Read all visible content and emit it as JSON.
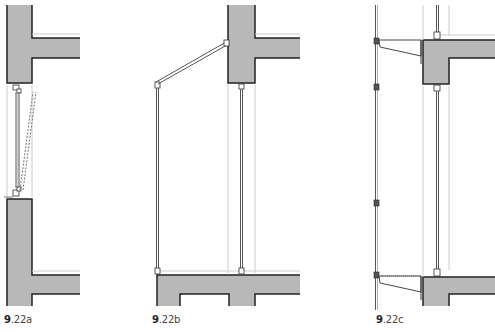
{
  "colors": {
    "concrete_fill": "#b8b8b8",
    "outline": "#222222",
    "frame_line": "#555555",
    "guide_line": "#cccccc",
    "background": "#ffffff"
  },
  "figures": [
    {
      "id": "9.22a",
      "caption_number": "9",
      "caption_suffix": ".22a",
      "description": "Pivot window between slab edges, shown closed and open (dashed)"
    },
    {
      "id": "9.22b",
      "caption_number": "9",
      "caption_suffix": ".22b",
      "description": "Outward projecting hinged panel with stay arm from upper slab"
    },
    {
      "id": "9.22c",
      "caption_number": "9",
      "caption_suffix": ".22c",
      "description": "Double-skin facade with outer panel supported on brackets from slab edges"
    }
  ]
}
